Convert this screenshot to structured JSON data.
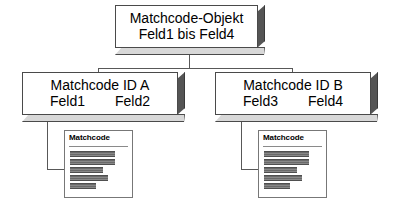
{
  "diagram": {
    "root_box": {
      "line1": "Matchcode-Objekt",
      "line2": "Feld1 bis Feld4"
    },
    "id_boxes": [
      {
        "line1": "Matchcode ID A",
        "field_left": "Feld1",
        "field_right": "Feld2"
      },
      {
        "line1": "Matchcode ID B",
        "field_left": "Feld3",
        "field_right": "Feld4"
      }
    ],
    "result_windows": [
      {
        "title": "Matchcode",
        "bar_widths": [
          45,
          45,
          33,
          38,
          26
        ]
      },
      {
        "title": "Matchcode",
        "bar_widths": [
          45,
          45,
          33,
          38,
          26
        ]
      }
    ],
    "colors": {
      "box_fill": "#ffffff",
      "box_outline": "#4a4a4a",
      "shadow_right": "#555555",
      "shadow_bottom": "#d8d8d8",
      "connector": "#585858",
      "bar_fill": "#6a6a6a",
      "window_outline": "#777777"
    }
  }
}
